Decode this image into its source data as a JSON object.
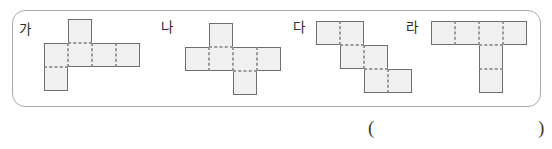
{
  "panel": {
    "name": "net-options-panel",
    "border_color": "#a8aaad"
  },
  "nets": [
    {
      "label": "가",
      "name": "net-ga",
      "cell_fill": "#f0f0f0",
      "edge_color": "#6e6e6e",
      "fold_color": "#9a9a9a",
      "cell_size": 24,
      "cells": [
        {
          "col": 1,
          "row": 0
        },
        {
          "col": 0,
          "row": 1
        },
        {
          "col": 1,
          "row": 1
        },
        {
          "col": 2,
          "row": 1
        },
        {
          "col": 3,
          "row": 1
        },
        {
          "col": 0,
          "row": 2
        }
      ]
    },
    {
      "label": "나",
      "name": "net-na",
      "cell_fill": "#f0f0f0",
      "edge_color": "#6e6e6e",
      "fold_color": "#9a9a9a",
      "cell_size": 24,
      "cells": [
        {
          "col": 1,
          "row": 0
        },
        {
          "col": 0,
          "row": 1
        },
        {
          "col": 1,
          "row": 1
        },
        {
          "col": 2,
          "row": 1
        },
        {
          "col": 3,
          "row": 1
        },
        {
          "col": 2,
          "row": 2
        }
      ]
    },
    {
      "label": "다",
      "name": "net-da",
      "cell_fill": "#f0f0f0",
      "edge_color": "#6e6e6e",
      "fold_color": "#9a9a9a",
      "cell_size": 24,
      "cells": [
        {
          "col": 0,
          "row": 0
        },
        {
          "col": 1,
          "row": 0
        },
        {
          "col": 1,
          "row": 1
        },
        {
          "col": 2,
          "row": 1
        },
        {
          "col": 2,
          "row": 2
        },
        {
          "col": 3,
          "row": 2
        }
      ]
    },
    {
      "label": "라",
      "name": "net-ra",
      "cell_fill": "#f0f0f0",
      "edge_color": "#6e6e6e",
      "fold_color": "#9a9a9a",
      "cell_size": 24,
      "cells": [
        {
          "col": 0,
          "row": 0
        },
        {
          "col": 1,
          "row": 0
        },
        {
          "col": 2,
          "row": 0
        },
        {
          "col": 3,
          "row": 0
        },
        {
          "col": 2,
          "row": 1
        },
        {
          "col": 2,
          "row": 2
        }
      ]
    }
  ],
  "answer": {
    "open_paren": "(",
    "close_paren": ")",
    "value": ""
  }
}
